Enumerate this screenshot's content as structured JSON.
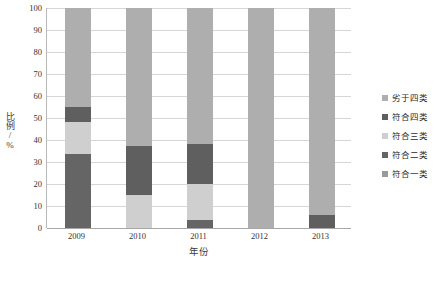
{
  "chart_data": {
    "type": "bar",
    "subtype": "stacked-100-percent",
    "title": "",
    "xlabel": "年份",
    "ylabel": "比例/%",
    "categories": [
      "2009",
      "2010",
      "2011",
      "2012",
      "2013"
    ],
    "ylim": [
      0,
      100
    ],
    "yticks": [
      0,
      10,
      20,
      30,
      40,
      50,
      60,
      70,
      80,
      90,
      100
    ],
    "ytick_labels": [
      "0",
      "10",
      "20",
      "30",
      "40",
      "50",
      "60",
      "70",
      "80",
      "90",
      "100"
    ],
    "grid": true,
    "grid_axis": "y",
    "legend_position": "right",
    "series": [
      {
        "name": "符合一类",
        "color": "#9a9a9a",
        "values": [
          0,
          0,
          0,
          0,
          0
        ]
      },
      {
        "name": "符合二类",
        "color": "#656565",
        "values": [
          33.5,
          0,
          3.5,
          0,
          0
        ]
      },
      {
        "name": "符合三类",
        "color": "#cfcfcf",
        "values": [
          14.5,
          15.2,
          16.5,
          0,
          0
        ]
      },
      {
        "name": "符合四类",
        "color": "#5f5f5f",
        "values": [
          7.0,
          22.1,
          18.3,
          0,
          6.0
        ]
      },
      {
        "name": "劣于四类",
        "color": "#aeaeae",
        "values": [
          45.0,
          62.7,
          61.7,
          100,
          94.0
        ]
      }
    ],
    "stack_order_bottom_to_top": [
      "符合一类",
      "符合二类",
      "符合三类",
      "符合四类",
      "劣于四类"
    ]
  },
  "legend": {
    "items": [
      {
        "label": "劣于四类",
        "color": "#aeaeae"
      },
      {
        "label": "符合四类",
        "color": "#5f5f5f"
      },
      {
        "label": "符合三类",
        "color": "#cfcfcf"
      },
      {
        "label": "符合二类",
        "color": "#656565"
      },
      {
        "label": "符合一类",
        "color": "#9a9a9a"
      }
    ]
  },
  "axes": {
    "y_title": "比例/%",
    "x_title": "年份"
  },
  "colors": {
    "gridline": "#d6d6d6",
    "axis": "#a8a8a8",
    "text": "#2b2b2b",
    "background": "#ffffff"
  }
}
